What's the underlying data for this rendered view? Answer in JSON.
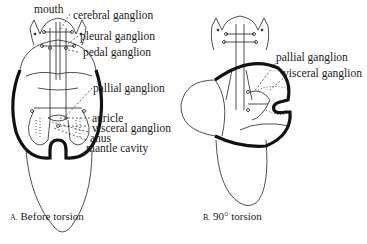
{
  "figure_a": {
    "caption_letter": "A.",
    "caption_text": "Before torsion",
    "labels": {
      "mouth": "mouth",
      "cerebral": "cerebral ganglion",
      "pleural": "pleural ganglion",
      "pedal": "pedal ganglion",
      "pallial": "pallial ganglion",
      "auricle": "auricle",
      "visceral": "visceral ganglion",
      "anus": "anus",
      "mantle": "mantle cavity"
    }
  },
  "figure_b": {
    "caption_letter": "B.",
    "caption_text": "90° torsion",
    "labels": {
      "pallial": "pallial ganglion",
      "visceral": "visceral ganglion"
    }
  }
}
